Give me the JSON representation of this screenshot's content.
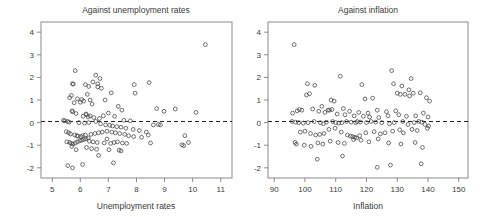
{
  "figure": {
    "width": 482,
    "height": 217,
    "background": "#ffffff",
    "point_color": "#4a4a4a",
    "axis_color": "#7d7d7d",
    "refline_color": "#1f1f1f",
    "marker": "open-circle"
  },
  "chart_data": [
    {
      "type": "scatter",
      "title": "Against unemployment rates",
      "xlabel": "Unemployment rates",
      "ylabel": "",
      "xlim": [
        4.6,
        11.4
      ],
      "ylim": [
        -2.45,
        4.45
      ],
      "xticks": [
        5,
        6,
        7,
        8,
        9,
        10,
        11
      ],
      "yticks": [
        4,
        3,
        2,
        1,
        0,
        -1,
        -2
      ],
      "xtick_labels": [
        "5",
        "6",
        "7",
        "8",
        "9",
        "10",
        "11"
      ],
      "ytick_labels": [
        "4",
        "3",
        "2",
        "1",
        "0",
        "-1",
        "-2"
      ],
      "grid": false,
      "legend": null,
      "annotations": [
        {
          "kind": "hline",
          "y": 0.05,
          "style": "dashed",
          "label": "zero reference line"
        }
      ],
      "x": [
        10.45,
        5.82,
        6.55,
        6.7,
        6.45,
        6.62,
        5.72,
        5.75,
        6.18,
        6.3,
        6.62,
        6.75,
        7.92,
        8.45,
        7.95,
        6.25,
        5.68,
        5.62,
        5.9,
        6.05,
        6.35,
        6.12,
        6.88,
        7.1,
        7.35,
        6.0,
        5.78,
        6.42,
        7.48,
        8.72,
        8.98,
        9.38,
        10.12,
        5.7,
        5.73,
        5.85,
        6.2,
        6.22,
        6.35,
        5.4,
        5.45,
        6.1,
        6.28,
        6.48,
        6.68,
        6.82,
        7.0,
        7.22,
        7.55,
        7.78,
        5.55,
        5.6,
        5.95,
        6.15,
        6.3,
        6.55,
        6.72,
        6.9,
        7.05,
        7.15,
        7.3,
        7.45,
        7.62,
        7.88,
        8.1,
        8.35,
        8.6,
        8.78,
        8.85,
        5.5,
        5.58,
        5.65,
        5.8,
        5.88,
        5.92,
        6.02,
        6.08,
        6.18,
        6.38,
        6.52,
        6.65,
        6.78,
        6.95,
        7.12,
        7.25,
        7.4,
        7.58,
        7.72,
        7.9,
        8.18,
        8.42,
        8.5,
        9.62,
        9.68,
        9.72,
        9.85,
        5.52,
        5.62,
        5.68,
        5.74,
        5.82,
        5.9,
        5.98,
        6.05,
        6.12,
        6.2,
        6.32,
        6.45,
        6.6,
        6.85,
        7.08,
        7.2,
        7.32,
        7.5,
        7.65,
        6.22,
        6.4,
        6.58,
        7.02,
        7.38,
        5.55,
        5.72,
        6.08,
        6.65,
        7.18,
        7.45,
        5.7,
        5.85,
        6.28,
        6.95
      ],
      "y": [
        3.45,
        2.3,
        2.1,
        1.95,
        1.8,
        1.72,
        1.72,
        1.7,
        1.68,
        1.6,
        1.58,
        1.52,
        1.68,
        1.77,
        1.3,
        1.25,
        1.2,
        1.1,
        1.05,
        1.02,
        1.0,
        0.95,
        1.0,
        1.32,
        0.72,
        0.9,
        0.88,
        0.82,
        0.55,
        0.62,
        0.5,
        0.6,
        0.45,
        0.52,
        0.48,
        0.4,
        0.38,
        0.35,
        0.3,
        0.1,
        0.08,
        0.28,
        0.25,
        0.22,
        0.18,
        0.3,
        0.42,
        0.28,
        0.1,
        0.08,
        0.05,
        0.02,
        0.0,
        -0.02,
        0.0,
        0.05,
        -0.05,
        -0.1,
        -0.12,
        -0.15,
        -0.18,
        -0.2,
        -0.25,
        -0.3,
        -0.35,
        -0.42,
        -0.1,
        -0.08,
        -0.1,
        -0.4,
        -0.45,
        -0.5,
        -0.55,
        -0.58,
        -0.6,
        -0.62,
        -0.58,
        -0.55,
        -0.52,
        -0.48,
        -0.45,
        -0.42,
        -0.38,
        -0.42,
        -0.45,
        -0.48,
        -0.52,
        -0.58,
        -0.62,
        -0.65,
        -0.55,
        -0.9,
        -0.98,
        -1.02,
        -0.58,
        -0.88,
        -0.85,
        -0.88,
        -0.92,
        -0.95,
        -0.9,
        -0.85,
        -0.8,
        -0.78,
        -0.75,
        -0.72,
        -0.82,
        -0.85,
        -0.88,
        -0.9,
        -0.92,
        -0.88,
        -0.85,
        -0.9,
        -0.92,
        -1.1,
        -1.15,
        -1.18,
        -1.2,
        -1.22,
        -1.9,
        -2.0,
        -1.85,
        -1.45,
        -1.78,
        -1.25,
        -1.05,
        -1.2,
        -0.68,
        -0.72
      ]
    },
    {
      "type": "scatter",
      "title": "Against inflation",
      "xlabel": "Inflation",
      "ylabel": "",
      "xlim": [
        88,
        153
      ],
      "ylim": [
        -2.45,
        4.45
      ],
      "xticks": [
        90,
        100,
        110,
        120,
        130,
        140,
        150
      ],
      "yticks": [
        4,
        3,
        2,
        1,
        0,
        -1,
        -2
      ],
      "xtick_labels": [
        "90",
        "100",
        "110",
        "120",
        "130",
        "140",
        "150"
      ],
      "ytick_labels": [
        "4",
        "3",
        "2",
        "1",
        "0",
        "-1",
        "-2"
      ],
      "grid": false,
      "legend": null,
      "annotations": [
        {
          "kind": "hline",
          "y": 0.05,
          "style": "dashed",
          "label": "zero reference line"
        }
      ],
      "x": [
        96.5,
        128.2,
        111.5,
        134.5,
        100.8,
        103.2,
        118.5,
        128.8,
        131.5,
        133.8,
        135.2,
        131.0,
        101.5,
        100.5,
        108.5,
        109.5,
        119.5,
        122.0,
        130.0,
        132.5,
        134.0,
        137.5,
        139.5,
        140.5,
        105.5,
        107.5,
        112.5,
        114.5,
        117.5,
        120.5,
        123.5,
        126.5,
        129.5,
        96.0,
        97.5,
        98.2,
        99.0,
        102.5,
        104.5,
        106.5,
        108.0,
        108.8,
        110.5,
        113.0,
        116.0,
        119.0,
        121.0,
        124.0,
        127.0,
        130.5,
        133.0,
        136.0,
        138.5,
        140.0,
        95.8,
        97.0,
        98.0,
        99.5,
        101.0,
        103.0,
        105.0,
        106.0,
        107.0,
        109.0,
        110.0,
        111.0,
        112.0,
        113.5,
        115.0,
        116.5,
        117.0,
        118.0,
        120.0,
        121.5,
        123.0,
        125.0,
        127.5,
        129.0,
        131.8,
        133.5,
        135.5,
        137.0,
        138.0,
        139.0,
        140.2,
        96.8,
        98.5,
        100.0,
        101.8,
        103.5,
        104.8,
        106.2,
        107.8,
        109.8,
        111.8,
        113.8,
        114.8,
        115.5,
        116.2,
        116.8,
        117.8,
        119.8,
        122.5,
        124.5,
        126.0,
        128.5,
        130.8,
        132.0,
        134.8,
        136.5,
        139.8,
        97.2,
        99.8,
        102.0,
        104.2,
        105.8,
        108.2,
        110.8,
        112.8,
        115.8,
        118.2,
        120.8,
        123.8,
        127.2,
        131.2,
        135.8,
        138.2,
        104.0,
        112.2,
        123.5,
        127.8,
        137.8
      ],
      "y": [
        3.45,
        2.3,
        2.05,
        1.95,
        1.72,
        1.65,
        1.68,
        1.72,
        1.62,
        1.45,
        1.3,
        1.25,
        1.28,
        1.22,
        1.0,
        0.95,
        1.05,
        1.08,
        1.3,
        1.25,
        1.18,
        1.32,
        1.1,
        0.95,
        0.72,
        0.55,
        0.62,
        0.5,
        0.45,
        0.42,
        0.55,
        0.48,
        0.52,
        0.42,
        0.52,
        0.58,
        0.55,
        0.6,
        0.5,
        0.45,
        0.55,
        0.58,
        0.38,
        0.35,
        0.3,
        0.28,
        0.25,
        0.22,
        0.3,
        0.35,
        0.28,
        0.3,
        0.42,
        0.25,
        0.05,
        0.02,
        0.0,
        -0.02,
        0.0,
        0.05,
        0.0,
        -0.05,
        0.02,
        0.05,
        0.0,
        -0.02,
        0.0,
        0.05,
        0.02,
        0.0,
        0.05,
        0.02,
        0.0,
        0.05,
        0.02,
        0.0,
        -0.05,
        0.0,
        0.05,
        -0.08,
        0.0,
        0.05,
        0.02,
        -0.08,
        -0.15,
        -0.88,
        -0.42,
        -0.38,
        -0.48,
        -0.55,
        -0.52,
        -0.48,
        -0.3,
        -0.25,
        -0.42,
        -0.55,
        -0.6,
        -0.62,
        -0.65,
        -0.68,
        -0.58,
        -0.45,
        -0.4,
        -0.5,
        -0.45,
        -0.38,
        -0.32,
        -0.45,
        -0.3,
        -0.35,
        -0.25,
        -0.95,
        -1.0,
        -1.05,
        -0.9,
        -0.95,
        -0.82,
        -0.88,
        -0.92,
        -0.75,
        -0.78,
        -0.85,
        -0.72,
        -0.9,
        -0.95,
        -0.88,
        -1.1,
        -1.62,
        -1.48,
        -1.98,
        -1.88,
        -1.82
      ]
    }
  ]
}
